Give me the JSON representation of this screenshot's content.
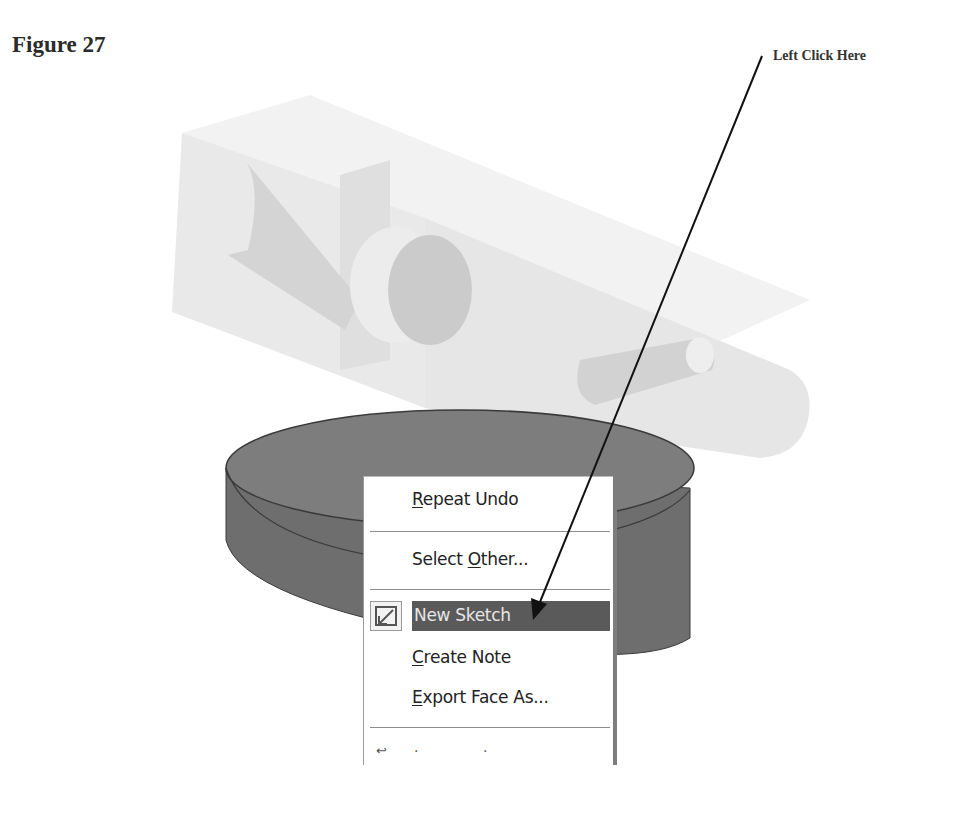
{
  "figure": {
    "title": "Figure 27",
    "callout": "Left Click Here"
  },
  "model": {
    "part_body": "translucent-block-with-bores",
    "selected_face": "cylinder-top-face",
    "colors": {
      "block": "#e6e6e6",
      "bore": "#cfcfcf",
      "cylinder_top": "#7a7a7a",
      "cylinder_side": "#6b6b6b",
      "highlight": "#5a5a5a"
    }
  },
  "context_menu": {
    "items": [
      {
        "pre": "",
        "mnemonic": "R",
        "post": "epeat Undo",
        "icon": null
      },
      {
        "pre": "Select ",
        "mnemonic": "O",
        "post": "ther...",
        "icon": null
      },
      {
        "pre": "New Sketch",
        "mnemonic": "",
        "post": "",
        "icon": "new-sketch-icon",
        "highlighted": true
      },
      {
        "pre": "",
        "mnemonic": "C",
        "post": "reate Note",
        "icon": null
      },
      {
        "pre": "",
        "mnemonic": "E",
        "post": "xport Face As...",
        "icon": null
      }
    ],
    "partial_item": {
      "icon": "return-arrow-icon",
      "text": ". ."
    }
  }
}
